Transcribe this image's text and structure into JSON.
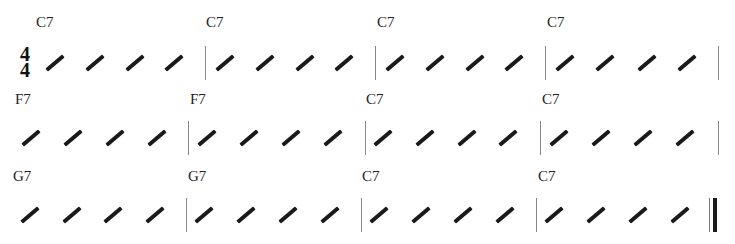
{
  "time_signature": {
    "numerator": "4",
    "denominator": "4"
  },
  "rows": [
    {
      "y_chord": 14,
      "y_slash": 61,
      "y_bar_top": 46,
      "bar_h": 34,
      "measures": [
        {
          "chord": "C7",
          "chord_x": 36,
          "slash_x": [
            44,
            84,
            124,
            163
          ]
        },
        {
          "chord": "C7",
          "chord_x": 206,
          "slash_x": [
            214,
            254,
            294,
            333
          ]
        },
        {
          "chord": "C7",
          "chord_x": 377,
          "slash_x": [
            384,
            424,
            464,
            503
          ]
        },
        {
          "chord": "C7",
          "chord_x": 547,
          "slash_x": [
            554,
            594,
            636,
            676
          ]
        }
      ],
      "barlines": [
        205,
        375,
        545,
        718
      ]
    },
    {
      "y_chord": 91,
      "y_slash": 136,
      "y_bar_top": 121,
      "bar_h": 34,
      "measures": [
        {
          "chord": "F7",
          "chord_x": 15,
          "slash_x": [
            20,
            62,
            104,
            146
          ]
        },
        {
          "chord": "F7",
          "chord_x": 190,
          "slash_x": [
            196,
            238,
            280,
            322
          ]
        },
        {
          "chord": "C7",
          "chord_x": 366,
          "slash_x": [
            372,
            414,
            456,
            497
          ]
        },
        {
          "chord": "C7",
          "chord_x": 542,
          "slash_x": [
            548,
            590,
            632,
            674
          ]
        }
      ],
      "barlines": [
        188,
        365,
        540,
        718
      ]
    },
    {
      "y_chord": 168,
      "y_slash": 213,
      "y_bar_top": 198,
      "bar_h": 34,
      "measures": [
        {
          "chord": "G7",
          "chord_x": 13,
          "slash_x": [
            19,
            61,
            102,
            144
          ]
        },
        {
          "chord": "G7",
          "chord_x": 188,
          "slash_x": [
            193,
            235,
            277,
            319
          ]
        },
        {
          "chord": "C7",
          "chord_x": 362,
          "slash_x": [
            368,
            410,
            452,
            494
          ]
        },
        {
          "chord": "C7",
          "chord_x": 538,
          "slash_x": [
            543,
            585,
            627,
            669
          ]
        }
      ],
      "barlines": [
        186,
        361,
        536
      ],
      "final_barline": {
        "thin_x": 709,
        "thick_x": 713
      }
    }
  ]
}
